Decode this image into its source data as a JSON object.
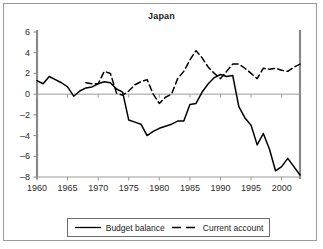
{
  "chart_data": {
    "type": "line",
    "title": "Japan",
    "xlabel": "",
    "ylabel": "",
    "xlim": [
      1960,
      2003
    ],
    "ylim": [
      -8,
      6
    ],
    "grid": false,
    "legend_position": "bottom",
    "xticks": [
      1960,
      1965,
      1970,
      1975,
      1980,
      1985,
      1990,
      1995,
      2000
    ],
    "yticks": [
      6,
      4,
      2,
      0,
      -2,
      -4,
      -6,
      -8
    ],
    "ytick_labels": [
      "6",
      "4",
      "2",
      "0",
      "–2",
      "–4",
      "–6",
      "–8"
    ],
    "xtick_labels": [
      "1960",
      "1965",
      "1970",
      "1975",
      "1980",
      "1985",
      "1990",
      "1995",
      "2000"
    ],
    "series": [
      {
        "name": "Budget balance",
        "style": "solid",
        "color": "#000000",
        "x": [
          1960,
          1961,
          1962,
          1963,
          1964,
          1965,
          1966,
          1967,
          1968,
          1969,
          1970,
          1971,
          1972,
          1973,
          1974,
          1975,
          1976,
          1977,
          1978,
          1979,
          1980,
          1981,
          1982,
          1983,
          1984,
          1985,
          1986,
          1987,
          1988,
          1989,
          1990,
          1991,
          1992,
          1993,
          1994,
          1995,
          1996,
          1997,
          1998,
          1999,
          2000,
          2001,
          2002,
          2003
        ],
        "y": [
          1.3,
          1.0,
          1.7,
          1.4,
          1.1,
          0.7,
          -0.2,
          0.3,
          0.6,
          0.7,
          1.0,
          1.2,
          1.1,
          0.5,
          0.2,
          -2.5,
          -2.7,
          -2.9,
          -4.0,
          -3.6,
          -3.3,
          -3.1,
          -2.9,
          -2.6,
          -2.6,
          -1.0,
          -0.9,
          0.2,
          1.0,
          1.6,
          1.9,
          1.7,
          1.8,
          -1.2,
          -2.3,
          -3.0,
          -4.9,
          -3.8,
          -5.3,
          -7.4,
          -7.0,
          -6.2,
          -7.0,
          -7.8
        ]
      },
      {
        "name": "Current account",
        "style": "dashed",
        "color": "#000000",
        "x": [
          1968,
          1969,
          1970,
          1971,
          1972,
          1973,
          1974,
          1975,
          1976,
          1977,
          1978,
          1979,
          1980,
          1981,
          1982,
          1983,
          1984,
          1985,
          1986,
          1987,
          1988,
          1989,
          1990,
          1991,
          1992,
          1993,
          1994,
          1995,
          1996,
          1997,
          1998,
          1999,
          2000,
          2001,
          2002,
          2003
        ],
        "y": [
          1.1,
          1.0,
          1.0,
          2.2,
          2.0,
          0.1,
          -0.1,
          0.3,
          0.9,
          1.2,
          1.4,
          0.0,
          -0.9,
          -0.3,
          0.0,
          1.5,
          2.2,
          3.3,
          4.2,
          3.5,
          2.6,
          2.0,
          1.5,
          2.2,
          2.9,
          2.9,
          2.5,
          2.0,
          1.5,
          2.5,
          2.4,
          2.5,
          2.3,
          2.2,
          2.6,
          2.9
        ]
      }
    ]
  },
  "legend": {
    "items": [
      {
        "label": "Budget balance",
        "style": "solid"
      },
      {
        "label": "Current account",
        "style": "dashed"
      }
    ]
  }
}
